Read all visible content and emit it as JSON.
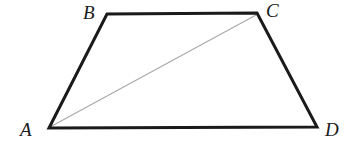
{
  "figure": {
    "kind": "geometry-diagram",
    "shape": "trapezoid",
    "background_color": "#ffffff",
    "outline_color": "#1a1a1a",
    "outline_width": 3,
    "diagonal_color": "#a8a8a8",
    "diagonal_width": 1,
    "label_color": "#1a1a1a",
    "vertices": [
      {
        "id": "A",
        "label": "A",
        "x": 49,
        "y": 128
      },
      {
        "id": "B",
        "label": "B",
        "x": 107,
        "y": 14
      },
      {
        "id": "C",
        "label": "C",
        "x": 257,
        "y": 13
      },
      {
        "id": "D",
        "label": "D",
        "x": 317,
        "y": 127
      }
    ],
    "outline_path": "M 49 128 L 107 14 L 257 13 L 317 127 Z",
    "edges": [
      {
        "id": "AB",
        "from": "A",
        "to": "B",
        "style": "thick-black"
      },
      {
        "id": "BC",
        "from": "B",
        "to": "C",
        "style": "thick-black"
      },
      {
        "id": "CD",
        "from": "C",
        "to": "D",
        "style": "thick-black"
      },
      {
        "id": "DA",
        "from": "D",
        "to": "A",
        "style": "thick-black"
      }
    ],
    "diagonals": [
      {
        "id": "AC",
        "from": "A",
        "to": "C",
        "style": "thin-gray",
        "x1": 50,
        "y1": 127,
        "x2": 256,
        "y2": 15
      }
    ],
    "labels": {
      "A": "A",
      "B": "B",
      "C": "C",
      "D": "D"
    }
  }
}
